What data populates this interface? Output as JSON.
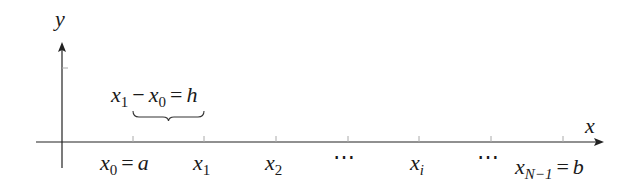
{
  "diagram": {
    "axes": {
      "x_label": "x",
      "y_label": "y"
    },
    "brace_annotation": {
      "lhs_a": "x",
      "lhs_a_sub": "1",
      "minus": "−",
      "lhs_b": "x",
      "lhs_b_sub": "0",
      "equals": "=",
      "rhs": "h"
    },
    "ticks": [
      {
        "base": "x",
        "sub": "0",
        "eq": "=",
        "value": "a"
      },
      {
        "base": "x",
        "sub": "1"
      },
      {
        "base": "x",
        "sub": "2"
      },
      {
        "ellipsis": "⋯"
      },
      {
        "base": "x",
        "sub": "i"
      },
      {
        "ellipsis": "⋯"
      },
      {
        "base": "x",
        "sub": "N−1",
        "eq": "=",
        "value": "b"
      }
    ]
  }
}
